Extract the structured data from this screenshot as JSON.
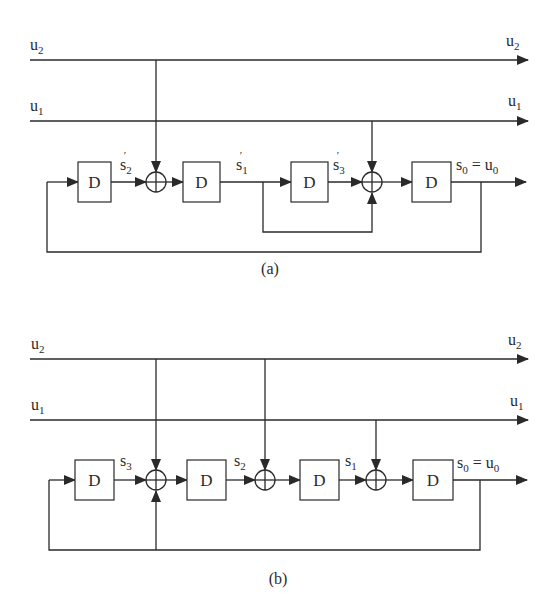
{
  "figure": {
    "panels": [
      {
        "id": "a",
        "caption": "(a)",
        "inputs": [
          {
            "label_base": "u",
            "label_sub": "2"
          },
          {
            "label_base": "u",
            "label_sub": "1"
          }
        ],
        "outputs": [
          {
            "label_base": "u",
            "label_sub": "2"
          },
          {
            "label_base": "u",
            "label_sub": "1"
          }
        ],
        "delay_label": "D",
        "state_labels": [
          {
            "base": "s",
            "sub": "2",
            "prime": "′"
          },
          {
            "base": "s",
            "sub": "1",
            "prime": "′"
          },
          {
            "base": "s",
            "sub": "3",
            "prime": "′"
          }
        ],
        "output_label": {
          "left_base": "s",
          "left_sub": "0",
          "eq": " = ",
          "right_base": "u",
          "right_sub": "0"
        }
      },
      {
        "id": "b",
        "caption": "(b)",
        "inputs": [
          {
            "label_base": "u",
            "label_sub": "2"
          },
          {
            "label_base": "u",
            "label_sub": "1"
          }
        ],
        "outputs": [
          {
            "label_base": "u",
            "label_sub": "2"
          },
          {
            "label_base": "u",
            "label_sub": "1"
          }
        ],
        "delay_label": "D",
        "state_labels": [
          {
            "base": "s",
            "sub": "3"
          },
          {
            "base": "s",
            "sub": "2"
          },
          {
            "base": "s",
            "sub": "1"
          }
        ],
        "output_label": {
          "left_base": "s",
          "left_sub": "0",
          "eq": " = ",
          "right_base": "u",
          "right_sub": "0"
        }
      }
    ]
  }
}
